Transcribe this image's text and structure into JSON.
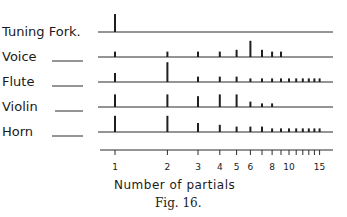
{
  "figure": {
    "caption": "Fig. 16.",
    "axis_title": "Number of partials"
  },
  "chart_data": {
    "type": "bar",
    "title": "",
    "xlabel": "Number of partials",
    "ylabel": "",
    "x_scale": "log",
    "x_tick_labels": [
      "1",
      "2",
      "3",
      "4",
      "5",
      "6",
      "8",
      "10",
      "15"
    ],
    "x_ticks": [
      1,
      2,
      3,
      4,
      5,
      6,
      7,
      8,
      9,
      10,
      11,
      12,
      13,
      14,
      15
    ],
    "series": [
      {
        "name": "Tuning Fork.",
        "partials": [
          1
        ],
        "values": [
          10
        ]
      },
      {
        "name": "Voice",
        "partials": [
          1,
          2,
          3,
          4,
          5,
          6,
          7,
          8,
          9
        ],
        "values": [
          3,
          3,
          3,
          3,
          4,
          9,
          4,
          3,
          3
        ]
      },
      {
        "name": "Flute",
        "partials": [
          1,
          2,
          3,
          4,
          5,
          6,
          7,
          8,
          9,
          10,
          11,
          12,
          13,
          14,
          15
        ],
        "values": [
          5,
          11,
          3,
          3,
          3,
          2,
          2,
          2,
          2,
          2,
          2,
          2,
          2,
          2,
          2
        ]
      },
      {
        "name": "Violin",
        "partials": [
          1,
          2,
          3,
          4,
          5,
          6,
          7,
          8
        ],
        "values": [
          7,
          7,
          6,
          7,
          7,
          3,
          2,
          2
        ]
      },
      {
        "name": "Horn",
        "partials": [
          1,
          2,
          3,
          4,
          5,
          6,
          7,
          8,
          9,
          10,
          11,
          12,
          13,
          14,
          15
        ],
        "values": [
          9,
          9,
          5,
          4,
          3,
          3,
          3,
          2,
          2,
          2,
          2,
          2,
          2,
          2,
          2
        ]
      }
    ]
  },
  "rows": [
    {
      "label": "Tuning Fork.",
      "dash": false
    },
    {
      "label": "Voice",
      "dash": true
    },
    {
      "label": "Flute",
      "dash": true
    },
    {
      "label": "Violin",
      "dash": true
    },
    {
      "label": "Horn",
      "dash": true
    }
  ]
}
